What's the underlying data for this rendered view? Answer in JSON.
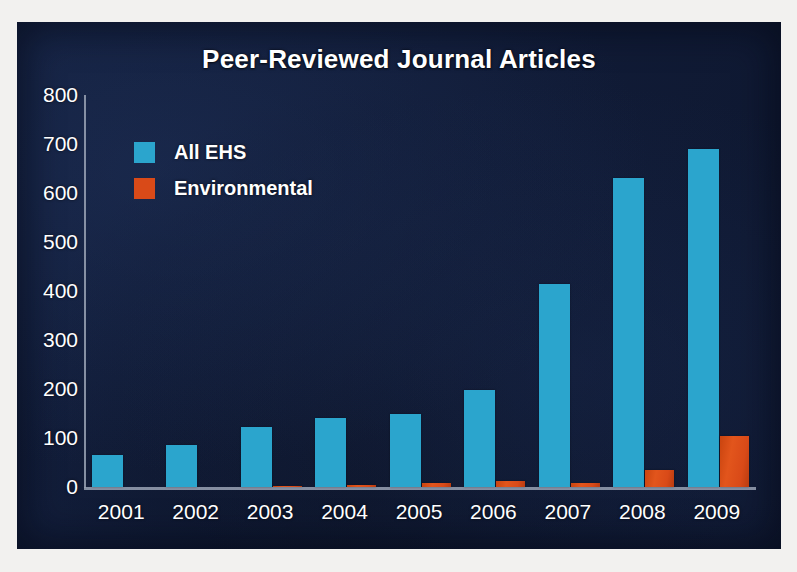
{
  "chart_data": {
    "type": "bar",
    "title": "Peer-Reviewed Journal Articles",
    "xlabel": "",
    "ylabel": "",
    "categories": [
      "2001",
      "2002",
      "2003",
      "2004",
      "2005",
      "2006",
      "2007",
      "2008",
      "2009"
    ],
    "series": [
      {
        "name": "All EHS",
        "color": "#2ba5cd",
        "values": [
          65,
          85,
          122,
          140,
          150,
          197,
          415,
          630,
          690
        ]
      },
      {
        "name": "Environmental",
        "color": "#d94a18",
        "values": [
          0,
          0,
          3,
          5,
          8,
          12,
          8,
          35,
          105
        ]
      }
    ],
    "ylim": [
      0,
      800
    ],
    "ytick_labels": [
      "800",
      "700",
      "600",
      "500",
      "400",
      "300",
      "200",
      "100",
      "0"
    ],
    "ytick_values": [
      800,
      700,
      600,
      500,
      400,
      300,
      200,
      100,
      0
    ],
    "grid": false,
    "legend_position": "upper left",
    "background_color": "#111c38",
    "text_color": "#ffffff",
    "axis_color": "#9aa3b5"
  },
  "legend": {
    "entries": [
      {
        "label": "All EHS",
        "color": "#2ba5cd"
      },
      {
        "label": "Environmental",
        "color": "#d94a18"
      }
    ]
  }
}
